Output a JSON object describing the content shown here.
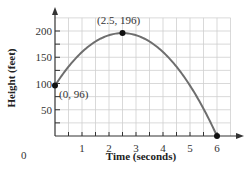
{
  "chart_data": {
    "type": "line",
    "title": "",
    "xlabel": "Time (seconds)",
    "ylabel": "Height (feet)",
    "xlim": [
      0,
      6.5
    ],
    "ylim": [
      0,
      225
    ],
    "x_ticks": [
      0,
      1,
      2,
      3,
      4,
      5,
      6
    ],
    "x_tick_labels": [
      "0",
      "1",
      "2",
      "3",
      "4",
      "5",
      "6"
    ],
    "y_ticks": [
      50,
      100,
      150,
      200
    ],
    "y_tick_labels": [
      "50",
      "100",
      "150",
      "200"
    ],
    "grid": true,
    "grid_step_x": 0.5,
    "grid_step_y": 25,
    "series": [
      {
        "name": "h(t) = -16t^2 + 80t + 96",
        "color": "#6e6e6e",
        "x": [
          0,
          0.5,
          1,
          1.5,
          2,
          2.5,
          3,
          3.5,
          4,
          4.5,
          5,
          5.5,
          6
        ],
        "values": [
          96,
          132,
          160,
          180,
          192,
          196,
          192,
          180,
          160,
          132,
          96,
          52,
          0
        ]
      }
    ],
    "annotations": [
      {
        "label": "(0, 96)",
        "x": 0,
        "y": 96
      },
      {
        "label": "(2.5, 196)",
        "x": 2.5,
        "y": 196
      },
      {
        "label": "",
        "x": 6,
        "y": 0
      }
    ]
  },
  "labels": {
    "origin": "0",
    "x_axis_title": "Time (seconds)",
    "y_axis_title": "Height (feet)",
    "start_point": "(0, 96)",
    "vertex_point": "(2.5, 196)"
  }
}
